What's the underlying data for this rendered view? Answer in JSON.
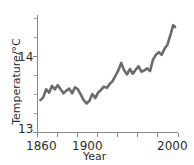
{
  "figure": {
    "background_color": "#ffffff",
    "line_color": "#6b6b6b",
    "axis_color": "#8a8a8a",
    "text_color": "#2e2e2e",
    "clipped_caption": "·  ··      ··"
  },
  "chart_data": {
    "type": "line",
    "title": "",
    "xlabel": "Year",
    "ylabel": "Temperature/°C",
    "xlim": [
      1857,
      2003
    ],
    "ylim": [
      12.88,
      14.62
    ],
    "grid": false,
    "legend": null,
    "x_ticks_labeled": [
      1860,
      1900,
      2000
    ],
    "x_tick_labels": [
      "1860",
      "1900",
      "2000"
    ],
    "x_ticks_all": [
      1860,
      1880,
      1900,
      1920,
      1940,
      1960,
      1980,
      2000
    ],
    "y_ticks_labeled": [
      13,
      14
    ],
    "y_tick_labels": [
      "13",
      "14"
    ],
    "y_ticks_all": [
      13.0,
      13.25,
      13.5,
      13.75,
      14.0,
      14.25,
      14.5
    ],
    "series": [
      {
        "name": "Global mean surface temperature",
        "x": [
          1860,
          1863,
          1866,
          1869,
          1872,
          1875,
          1878,
          1881,
          1884,
          1887,
          1890,
          1893,
          1896,
          1899,
          1902,
          1905,
          1908,
          1911,
          1914,
          1917,
          1920,
          1923,
          1926,
          1929,
          1932,
          1935,
          1938,
          1941,
          1944,
          1947,
          1950,
          1953,
          1956,
          1959,
          1962,
          1965,
          1968,
          1971,
          1974,
          1977,
          1980,
          1983,
          1986,
          1989,
          1992,
          1995,
          1998,
          2000
        ],
        "y": [
          13.36,
          13.4,
          13.52,
          13.47,
          13.57,
          13.52,
          13.58,
          13.52,
          13.46,
          13.5,
          13.53,
          13.46,
          13.55,
          13.52,
          13.44,
          13.36,
          13.31,
          13.35,
          13.45,
          13.39,
          13.47,
          13.51,
          13.56,
          13.54,
          13.6,
          13.64,
          13.72,
          13.8,
          13.91,
          13.8,
          13.74,
          13.82,
          13.75,
          13.81,
          13.86,
          13.78,
          13.8,
          13.83,
          13.79,
          13.96,
          14.03,
          14.07,
          14.03,
          14.12,
          14.18,
          14.32,
          14.47,
          14.44
        ]
      }
    ]
  },
  "labels": {
    "y_top": "14",
    "y_bottom": "13",
    "x_first": "1860",
    "x_second": "1900",
    "x_last": "2000",
    "y_axis_title": "Temperature/°C",
    "x_axis_title": "Year"
  }
}
